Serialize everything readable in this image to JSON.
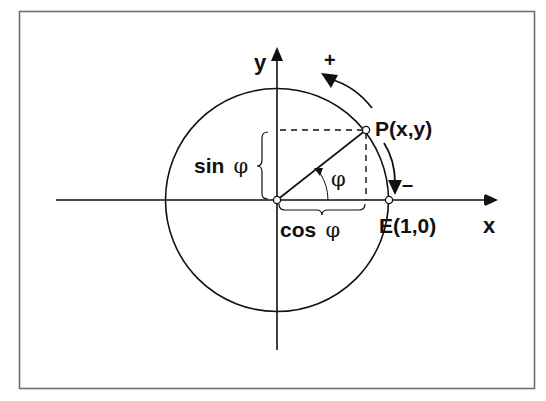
{
  "diagram": {
    "type": "unit-circle",
    "labels": {
      "y_axis": "y",
      "x_axis": "x",
      "point_p": "P(x,y)",
      "point_e": "E(1,0)",
      "plus": "+",
      "minus": "–",
      "sin_label": "sin",
      "cos_label": "cos",
      "phi": "φ"
    },
    "colors": {
      "stroke": "#111111",
      "frame": "#6e6e6e",
      "background": "#ffffff"
    }
  }
}
